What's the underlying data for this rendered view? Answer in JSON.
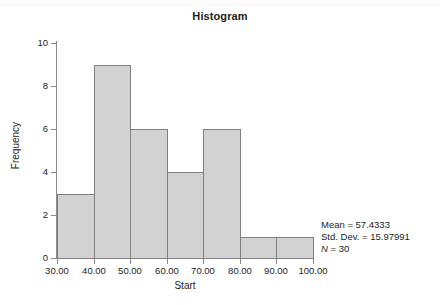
{
  "chart_data": {
    "type": "bar",
    "title": "Histogram",
    "xlabel": "Start",
    "ylabel": "Frequency",
    "categories": [
      "30.00-40.00",
      "40.00-50.00",
      "50.00-60.00",
      "60.00-70.00",
      "70.00-80.00",
      "80.00-90.00",
      "90.00-100.00"
    ],
    "bin_edges": [
      30,
      40,
      50,
      60,
      70,
      80,
      90,
      100
    ],
    "values": [
      3,
      9,
      6,
      4,
      6,
      1,
      1
    ],
    "xlim": [
      30,
      100
    ],
    "ylim": [
      0,
      10
    ],
    "xticks": [
      30,
      40,
      50,
      60,
      70,
      80,
      90,
      100
    ],
    "xtick_labels": [
      "30.00",
      "40.00",
      "50.00",
      "60.00",
      "70.00",
      "80.00",
      "90.00",
      "100.00"
    ],
    "yticks": [
      0,
      2,
      4,
      6,
      8,
      10
    ],
    "ytick_labels": [
      "0",
      "2",
      "4",
      "6",
      "8",
      "10"
    ],
    "grid": false,
    "legend": null,
    "bar_fill_color": "#d2d2d2",
    "bar_border_color": "#808080",
    "axis_color": "#8a8a8a",
    "text_color": "#1d1d1d",
    "annotations": {
      "mean_label": "Mean = 57.4333",
      "std_dev_label": "Std. Dev. = 15.97991",
      "n_symbol": "N",
      "n_value": " = 30",
      "position": "bottom-right"
    }
  }
}
